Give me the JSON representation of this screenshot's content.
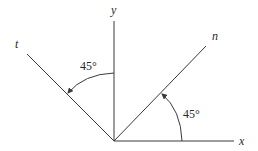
{
  "diagram": {
    "axes": {
      "x": {
        "label": "x"
      },
      "y": {
        "label": "y"
      },
      "n": {
        "label": "n"
      },
      "t": {
        "label": "t"
      }
    },
    "angles": {
      "x_to_n": {
        "label": "45°"
      },
      "y_to_t": {
        "label": "45°"
      }
    },
    "colors": {
      "line": "#3a3a3a",
      "text": "#2a2a2a",
      "background": "#ffffff"
    }
  }
}
